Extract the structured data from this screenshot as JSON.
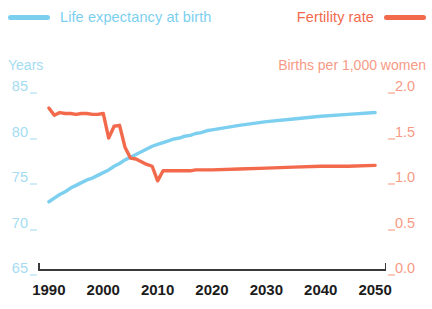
{
  "legend": {
    "life_label": "Life expectancy at birth",
    "fertility_label": "Fertility rate",
    "life_color": "#7CCFEF",
    "fertility_color": "#F2694C"
  },
  "axes": {
    "left_caption": "Years",
    "right_caption": "Births per 1,000 women",
    "left_ticks": [
      "85",
      "80",
      "75",
      "70",
      "65"
    ],
    "right_ticks": [
      "2.0",
      "1.5",
      "1.0",
      "0.5",
      "0.0"
    ],
    "x_ticks": [
      "1990",
      "2000",
      "2010",
      "2020",
      "2030",
      "2040",
      "2050"
    ]
  },
  "chart_data": {
    "type": "line",
    "title": "",
    "xlabel": "",
    "grid": false,
    "legend_position": "top",
    "x": [
      1990,
      1991,
      1992,
      1993,
      1994,
      1995,
      1996,
      1997,
      1998,
      1999,
      2000,
      2001,
      2002,
      2003,
      2004,
      2005,
      2006,
      2007,
      2008,
      2009,
      2010,
      2011,
      2012,
      2013,
      2014,
      2015,
      2016,
      2017,
      2018,
      2019,
      2020,
      2025,
      2030,
      2035,
      2040,
      2045,
      2050
    ],
    "xlim": [
      1988,
      2052
    ],
    "series": [
      {
        "name": "Life expectancy at birth",
        "color": "#7CCFEF",
        "axis": "left",
        "ylabel": "Years",
        "ylim": [
          65,
          85
        ],
        "yticks": [
          65,
          70,
          75,
          80,
          85
        ],
        "values": [
          72.5,
          72.9,
          73.3,
          73.6,
          74.0,
          74.3,
          74.6,
          74.9,
          75.1,
          75.4,
          75.7,
          76.0,
          76.4,
          76.7,
          77.1,
          77.4,
          77.7,
          78.0,
          78.3,
          78.6,
          78.8,
          79.0,
          79.2,
          79.4,
          79.5,
          79.7,
          79.8,
          80.0,
          80.1,
          80.3,
          80.4,
          80.9,
          81.3,
          81.6,
          81.9,
          82.1,
          82.3
        ]
      },
      {
        "name": "Fertility rate",
        "color": "#F2694C",
        "axis": "right",
        "ylabel": "Births per 1,000 women",
        "ylim": [
          0.0,
          2.0
        ],
        "yticks": [
          0.0,
          0.5,
          1.0,
          1.5,
          2.0
        ],
        "values": [
          1.78,
          1.7,
          1.73,
          1.72,
          1.72,
          1.71,
          1.72,
          1.72,
          1.71,
          1.71,
          1.72,
          1.45,
          1.58,
          1.59,
          1.35,
          1.23,
          1.22,
          1.19,
          1.16,
          1.14,
          0.98,
          1.09,
          1.09,
          1.09,
          1.09,
          1.09,
          1.09,
          1.1,
          1.1,
          1.1,
          1.1,
          1.11,
          1.12,
          1.13,
          1.14,
          1.14,
          1.15
        ]
      }
    ]
  }
}
